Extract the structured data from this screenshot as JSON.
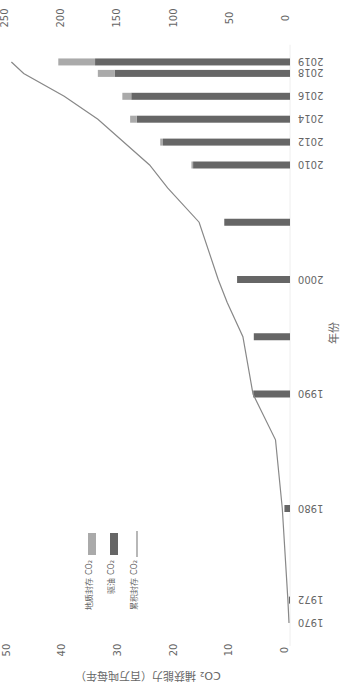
{
  "chart_data": {
    "type": "bar",
    "orientation": "rotated-180",
    "title": "",
    "xlabel": "年份",
    "ylabel": "CO₂ 捕获能力（百万吨每年）",
    "y2label": "",
    "ylim": [
      0,
      50
    ],
    "y2lim": [
      0,
      250
    ],
    "yticks": [
      "0",
      "10",
      "20",
      "30",
      "40",
      "50"
    ],
    "y2ticks": [
      "0",
      "50",
      "100",
      "150",
      "200",
      "250"
    ],
    "grid": false,
    "legend_position": "left-middle",
    "categories": [
      "1970",
      "1972",
      "1980",
      "1990",
      "1995",
      "2000",
      "2005",
      "2010",
      "2012",
      "2014",
      "2016",
      "2018",
      "2019"
    ],
    "category_labels": [
      "1970",
      "1972",
      "1980",
      "1990",
      "",
      "2000",
      "",
      "2010",
      "2012",
      "2014",
      "2016",
      "2018",
      "2019"
    ],
    "series": [
      {
        "name": "驱油 CO₂",
        "kind": "bar",
        "color": "#666666",
        "values": [
          0,
          0.2,
          1.0,
          6.6,
          6.5,
          9.5,
          11.8,
          17.4,
          22.8,
          27.5,
          28.5,
          31.5,
          35.0
        ]
      },
      {
        "name": "地质封存 CO₂",
        "kind": "bar",
        "color": "#aaaaaa",
        "values": [
          0,
          0,
          0,
          0,
          0,
          0,
          0,
          0.3,
          0.5,
          1.2,
          1.6,
          3.0,
          6.6
        ]
      },
      {
        "name": "累积封存 CO₂",
        "kind": "line",
        "axis": "secondary",
        "color": "#888888",
        "x": [
          1970,
          1972,
          1980,
          1986,
          1990,
          1995,
          1998,
          2000,
          2005,
          2008,
          2010,
          2014,
          2016,
          2018,
          2019
        ],
        "values": [
          0,
          1,
          6,
          12,
          32,
          41,
          55,
          63,
          80,
          108,
          124,
          170,
          200,
          236,
          247
        ]
      }
    ],
    "legend": [
      {
        "label": "地质封存 CO₂",
        "swatch": "bar",
        "color": "#aaaaaa"
      },
      {
        "label": "驱油 CO₂",
        "swatch": "bar",
        "color": "#666666"
      },
      {
        "label": "累积封存 CO₂",
        "swatch": "line",
        "color": "#888888"
      }
    ]
  }
}
